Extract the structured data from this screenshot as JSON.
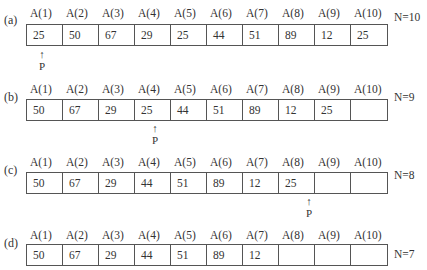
{
  "headers": [
    "A(1)",
    "A(2)",
    "A(3)",
    "A(4)",
    "A(5)",
    "A(6)",
    "A(7)",
    "A(8)",
    "A(9)",
    "A(10)"
  ],
  "pointer": {
    "arrow": "↑",
    "label": "P"
  },
  "rows": [
    {
      "tag": "(a)",
      "values": [
        "25",
        "50",
        "67",
        "29",
        "25",
        "44",
        "51",
        "89",
        "12",
        "25"
      ],
      "n": "N=10",
      "pointer_index": 0
    },
    {
      "tag": "(b)",
      "values": [
        "50",
        "67",
        "29",
        "25",
        "44",
        "51",
        "89",
        "12",
        "25",
        ""
      ],
      "n": "N=9",
      "pointer_index": 3
    },
    {
      "tag": "(c)",
      "values": [
        "50",
        "67",
        "29",
        "44",
        "51",
        "89",
        "12",
        "25",
        "",
        ""
      ],
      "n": "N=8",
      "pointer_index": 7
    },
    {
      "tag": "(d)",
      "values": [
        "50",
        "67",
        "29",
        "44",
        "51",
        "89",
        "12",
        "",
        "",
        ""
      ],
      "n": "N=7",
      "pointer_index": null
    }
  ]
}
